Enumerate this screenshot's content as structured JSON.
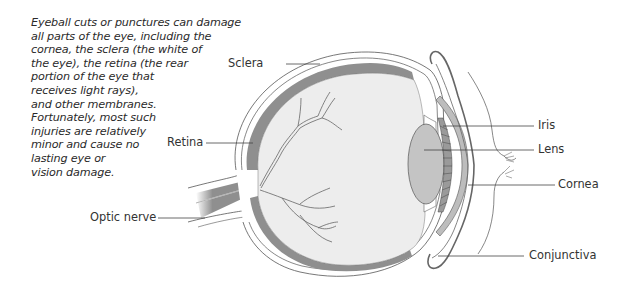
{
  "caption": {
    "lines": [
      "Eyeball cuts or punctures can damage",
      "all parts of the eye, including the",
      "cornea, the sclera (the white of",
      "the eye), the retina (the rear",
      "portion of the eye that",
      "receives light rays),",
      "and other membranes.",
      "Fortunately, most such",
      "injuries are relatively",
      "minor and cause no",
      "lasting eye or",
      "vision damage."
    ]
  },
  "diagram": {
    "labels": {
      "sclera": "Sclera",
      "retina": "Retina",
      "optic_nerve": "Optic nerve",
      "iris": "Iris",
      "lens": "Lens",
      "cornea": "Cornea",
      "conjunctiva": "Conjunctiva"
    },
    "colors": {
      "vitreous": "#ededed",
      "retina": "#8f8f8f",
      "lens": "#c4c4c4",
      "cornea": "#bdbdbd",
      "outline": "#555555",
      "leader_line": "#444444"
    }
  }
}
